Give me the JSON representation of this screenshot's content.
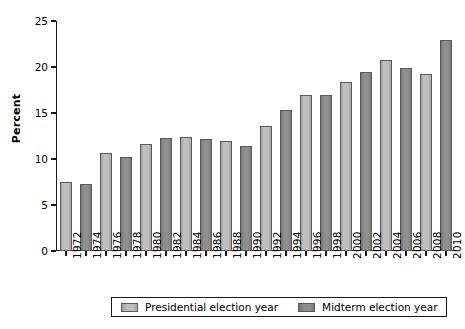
{
  "chart_data": {
    "type": "bar",
    "title": "",
    "xlabel": "",
    "ylabel": "Percent",
    "ylim": [
      0,
      25
    ],
    "yticks": [
      0,
      5,
      10,
      15,
      20,
      25
    ],
    "grid": false,
    "legend_position": "bottom",
    "categories": [
      "1972",
      "1974",
      "1976",
      "1978",
      "1980",
      "1982",
      "1984",
      "1986",
      "1988",
      "1990",
      "1992",
      "1994",
      "1996",
      "1998",
      "2000",
      "2002",
      "2004",
      "2006",
      "2008",
      "2010"
    ],
    "values": [
      7.5,
      7.3,
      10.7,
      10.2,
      11.6,
      12.3,
      12.4,
      12.2,
      12.0,
      11.4,
      13.6,
      15.3,
      17.0,
      17.0,
      18.4,
      19.5,
      20.8,
      19.9,
      19.2,
      22.9
    ],
    "groups": [
      "presidential",
      "midterm",
      "presidential",
      "midterm",
      "presidential",
      "midterm",
      "presidential",
      "midterm",
      "presidential",
      "midterm",
      "presidential",
      "midterm",
      "presidential",
      "midterm",
      "presidential",
      "midterm",
      "presidential",
      "midterm",
      "presidential",
      "midterm"
    ],
    "series": [
      {
        "name": "Presidential election year",
        "key": "presidential",
        "color": "#bdbdbd",
        "points": [
          {
            "x": "1972",
            "y": 7.5
          },
          {
            "x": "1976",
            "y": 10.7
          },
          {
            "x": "1980",
            "y": 11.6
          },
          {
            "x": "1984",
            "y": 12.4
          },
          {
            "x": "1988",
            "y": 12.0
          },
          {
            "x": "1992",
            "y": 13.6
          },
          {
            "x": "1996",
            "y": 17.0
          },
          {
            "x": "2000",
            "y": 18.4
          },
          {
            "x": "2004",
            "y": 20.8
          },
          {
            "x": "2008",
            "y": 19.2
          }
        ]
      },
      {
        "name": "Midterm election year",
        "key": "midterm",
        "color": "#8d8d8d",
        "points": [
          {
            "x": "1974",
            "y": 7.3
          },
          {
            "x": "1978",
            "y": 10.2
          },
          {
            "x": "1982",
            "y": 12.3
          },
          {
            "x": "1986",
            "y": 12.2
          },
          {
            "x": "1990",
            "y": 11.4
          },
          {
            "x": "1994",
            "y": 15.3
          },
          {
            "x": "1998",
            "y": 17.0
          },
          {
            "x": "2002",
            "y": 19.5
          },
          {
            "x": "2006",
            "y": 19.9
          },
          {
            "x": "2010",
            "y": 22.9
          }
        ]
      }
    ]
  },
  "legend": {
    "items": [
      {
        "label": "Presidential election year",
        "key": "presidential"
      },
      {
        "label": "Midterm election year",
        "key": "midterm"
      }
    ]
  },
  "colors": {
    "presidential": "#bdbdbd",
    "midterm": "#8d8d8d",
    "axis": "#1a1a1a",
    "background": "#ffffff"
  }
}
